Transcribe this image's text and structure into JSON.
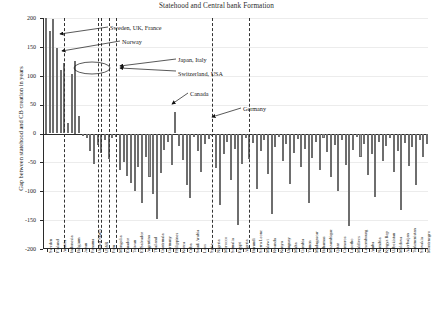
{
  "chart_data": {
    "type": "bar",
    "title": "Statehood and Central bank Formation",
    "xlabel": "",
    "ylabel": "Gap between statehood and CB creation in years",
    "ylim": [
      -200,
      200
    ],
    "yticks": [
      200,
      150,
      100,
      50,
      0,
      -50,
      -100,
      -150,
      -200
    ],
    "grid": true,
    "legend": "none",
    "categories": [
      "Sweden",
      "Finland",
      "Austria",
      "Indonesia",
      "Belgium",
      "Japan",
      "Panama",
      "United States",
      "USSR",
      "Peru",
      "Mongolia",
      "Ecuador",
      "Taiwan",
      "El Salvador",
      "Argentina",
      "Thailand",
      "Guatemala",
      "Germany",
      "Philippines",
      "Korea",
      "Cuba",
      "Saudi Arabia",
      "Laos",
      "Syria",
      "Nigeria",
      "Morocco",
      "Somalia",
      "Egypt",
      "Algeria",
      "Burundi",
      "Sierra Leone",
      "Malawi",
      "Rwanda",
      "Kenya",
      "Uruguay",
      "Malta",
      "Gambia",
      "Yemen",
      "Madagascar",
      "Bahamas",
      "Mozambique",
      "Qatar",
      "Comoros",
      "Lesotho",
      "Maldives",
      "Luxembourg",
      "Aruba",
      "Namibia",
      "Kyrgyz Rep",
      "Uzbekistan",
      "Moldova",
      "Azerbaijan",
      "Turkmenistan",
      "Slovakia",
      "Montenegro"
    ],
    "values": [
      205,
      200,
      198,
      148,
      125,
      122,
      108,
      103,
      100,
      62,
      8,
      -3,
      -6,
      -22,
      -30,
      -14,
      -42,
      -27,
      -38,
      -64,
      -54,
      -78,
      -86,
      -48,
      -104,
      -66,
      -92,
      -72,
      -112,
      -40,
      -145,
      -58,
      -36,
      -96,
      -20,
      12,
      38,
      -5,
      -30,
      -60,
      -118,
      -10,
      -74,
      -128,
      -44,
      6,
      -26,
      -160,
      -52,
      -18,
      -88,
      -34,
      -68,
      -24,
      -112
    ],
    "annotations": [
      {
        "label": "Sweden, UK, France"
      },
      {
        "label": "Norway"
      },
      {
        "label": "Japan, Italy"
      },
      {
        "label": "Switzerland, USA"
      },
      {
        "label": "Canada"
      },
      {
        "label": "Germany"
      }
    ]
  },
  "bar_heights": [
    205,
    178,
    198,
    148,
    110,
    122,
    18,
    103,
    125,
    30,
    -4,
    -8,
    -30,
    -52,
    -20,
    -34,
    -12,
    -44,
    -8,
    -6,
    -64,
    -50,
    -74,
    -86,
    -100,
    -58,
    -120,
    -40,
    -76,
    -104,
    -148,
    -68,
    -28,
    -14,
    -54,
    38,
    -22,
    -46,
    -90,
    -112,
    -6,
    -30,
    -66,
    -18,
    -10,
    -5,
    -60,
    -124,
    -36,
    -14,
    -80,
    -26,
    -158,
    -52,
    -8,
    -44,
    -16,
    -96,
    -30,
    -12,
    -70,
    -140,
    -24,
    -6,
    -48,
    -18,
    -88,
    -34,
    -10,
    -58,
    -26,
    -120,
    -42,
    -14,
    -64,
    -8,
    -32,
    -76,
    -20,
    -100,
    -12,
    -54,
    -160,
    -28,
    -6,
    -40,
    -18,
    -72,
    -36,
    -110,
    -14,
    -48,
    -22,
    -8,
    -66,
    -30,
    -132,
    -16,
    -56,
    -24,
    -90,
    -12,
    -40,
    -18
  ],
  "xlabels": [
    "Sweden",
    "Finland",
    "Austria",
    "Indonesia",
    "Belgium",
    "Japan",
    "Panama",
    "United States",
    "USSR",
    "Peru",
    "Mongolia",
    "Ecuador",
    "Taiwan",
    "El Salvador",
    "Argentina",
    "Thailand",
    "Guatemala",
    "Germany",
    "Philippines",
    "Korea",
    "Cuba",
    "Saudi Arabia",
    "Laos",
    "Syria",
    "Nigeria",
    "Morocco",
    "Somalia",
    "Egypt",
    "Algeria",
    "Burundi",
    "Sierra Leone",
    "Malawi",
    "Rwanda",
    "Kenya",
    "Uruguay",
    "Malta",
    "Gambia",
    "Yemen",
    "Madagascar",
    "Bahamas",
    "Mozambique",
    "Qatar",
    "Comoros",
    "Lesotho",
    "Maldives",
    "Luxembourg",
    "Aruba",
    "Namibia",
    "Kyrgyz Rep",
    "Uzbekistan",
    "Moldova",
    "Azerbaijan",
    "Turkmenistan",
    "Slovakia",
    "Montenegro"
  ]
}
